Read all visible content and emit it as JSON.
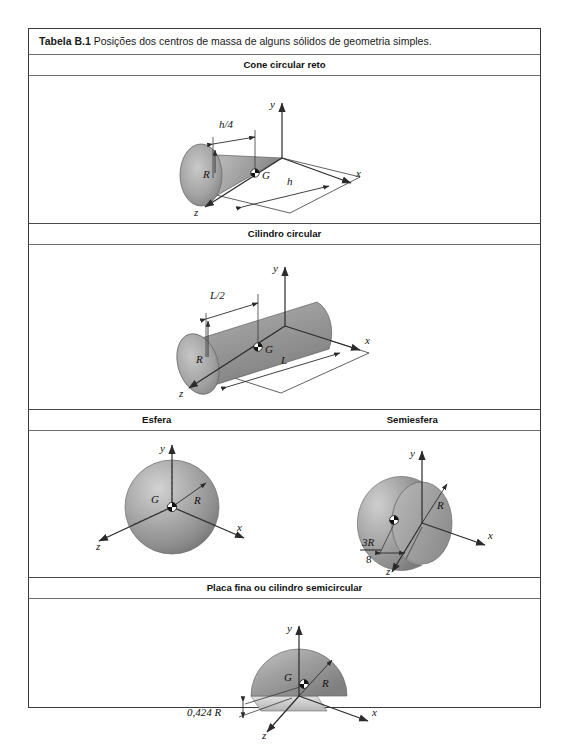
{
  "caption": {
    "number": "Tabela B.1",
    "text": "Posições dos centros de massa de alguns sólidos de geometria simples."
  },
  "sections": [
    {
      "id": "cone",
      "title": "Cone circular reto"
    },
    {
      "id": "cylinder",
      "title": "Cilindro circular"
    },
    {
      "id": "sphere",
      "title": "Esfera"
    },
    {
      "id": "hemisphere",
      "title": "Semiesfera"
    },
    {
      "id": "plate",
      "title": "Placa fina ou cilindro semicircular"
    }
  ],
  "axes": {
    "x": "x",
    "y": "y",
    "z": "z"
  },
  "centroid_symbol": "G",
  "figures": {
    "cone": {
      "name": "Cone circular reto",
      "centroid_label": "G",
      "radius_label": "R",
      "height_label": "h",
      "centroid_distance": "h/4",
      "centroid_distance_num": "h",
      "centroid_distance_den": "4"
    },
    "cylinder": {
      "name": "Cilindro circular",
      "centroid_label": "G",
      "radius_label": "R",
      "length_label": "L",
      "centroid_distance": "L/2",
      "centroid_distance_num": "L",
      "centroid_distance_den": "2"
    },
    "sphere": {
      "name": "Esfera",
      "centroid_label": "G",
      "radius_label": "R"
    },
    "hemisphere": {
      "name": "Semiesfera",
      "centroid_label": "G",
      "radius_label": "R",
      "centroid_distance_num": "3R",
      "centroid_distance_den": "8"
    },
    "plate": {
      "name": "Placa fina ou cilindro semicircular",
      "centroid_label": "G",
      "radius_label": "R",
      "centroid_distance": "0,424 R"
    }
  },
  "colors": {
    "page_background": "#ffffff",
    "table_border": "#3b3b3b",
    "rule": "#6f6f6f",
    "text": "#111111",
    "solid_light": "#d8d8d8",
    "solid_mid": "#a9a9a9",
    "solid_dark": "#7d7d7d",
    "line": "#2b2b2b"
  }
}
